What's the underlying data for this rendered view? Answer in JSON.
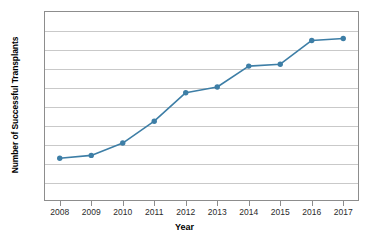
{
  "chart_data": {
    "type": "line",
    "title": "",
    "xlabel": "Year",
    "ylabel": "Number of Successful Transplants",
    "categories": [
      "2008",
      "2009",
      "2010",
      "2011",
      "2012",
      "2013",
      "2014",
      "2015",
      "2016",
      "2017"
    ],
    "x": [
      2008,
      2009,
      2010,
      2011,
      2012,
      2013,
      2014,
      2015,
      2016,
      2017
    ],
    "values": [
      45,
      48,
      61,
      84,
      114,
      120,
      142,
      144,
      169,
      171
    ],
    "series": [
      {
        "name": "Successful Transplants",
        "values": [
          45,
          48,
          61,
          84,
          114,
          120,
          142,
          144,
          169,
          171
        ]
      }
    ],
    "ylim": [
      0,
      200
    ],
    "ytick_labels": [
      "0",
      "20",
      "40",
      "60",
      "80",
      "100",
      "120",
      "140",
      "160",
      "180",
      "200"
    ],
    "yticks": [
      0,
      20,
      40,
      60,
      80,
      100,
      120,
      140,
      160,
      180,
      200
    ],
    "grid": true,
    "grid_axis": "y",
    "legend": false,
    "legend_position": "none",
    "marker": "circle",
    "line_color": "#3d7ea6",
    "marker_color": "#3d7ea6",
    "gridline_color": "#c9c9c9",
    "axis_color": "#8d8d8d",
    "background_color": "#ffffff"
  }
}
